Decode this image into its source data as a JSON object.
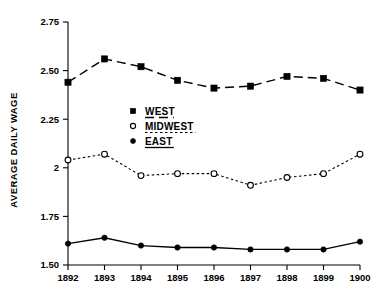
{
  "chart_data": {
    "type": "line",
    "title": "",
    "subtitle": "",
    "xlabel": "",
    "ylabel": "AVERAGE DAILY WAGE",
    "categories": [
      "1892",
      "1893",
      "1894",
      "1895",
      "1896",
      "1897",
      "1898",
      "1899",
      "1900"
    ],
    "x": [
      1892,
      1893,
      1894,
      1895,
      1896,
      1897,
      1898,
      1899,
      1900
    ],
    "xlim": [
      1892,
      1900
    ],
    "ylim": [
      1.5,
      2.75
    ],
    "yticks": [
      1.5,
      1.75,
      2.0,
      2.25,
      2.5,
      2.75
    ],
    "ytick_labels": [
      "1.50",
      "1.75",
      "2",
      "2.25",
      "2.50",
      "2.75"
    ],
    "grid": false,
    "legend_position": "center-left-inside",
    "series": [
      {
        "name": "WEST",
        "marker": "filled-square",
        "linestyle": "dashed",
        "color": "#000000",
        "values": [
          2.44,
          2.56,
          2.52,
          2.45,
          2.41,
          2.42,
          2.47,
          2.46,
          2.4
        ]
      },
      {
        "name": "MIDWEST",
        "marker": "open-circle",
        "linestyle": "dotted",
        "color": "#000000",
        "values": [
          2.04,
          2.07,
          1.96,
          1.97,
          1.97,
          1.91,
          1.95,
          1.97,
          2.07
        ]
      },
      {
        "name": "EAST",
        "marker": "filled-circle",
        "linestyle": "solid",
        "color": "#000000",
        "values": [
          1.61,
          1.64,
          1.6,
          1.59,
          1.59,
          1.58,
          1.58,
          1.58,
          1.62
        ]
      }
    ]
  }
}
